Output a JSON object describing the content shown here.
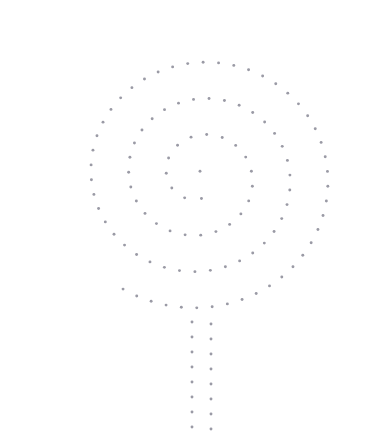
{
  "canvas": {
    "width": 376,
    "height": 437,
    "background_color": "#ffffff"
  },
  "marker": {
    "color": "#9a9aa5",
    "radius": 1.45,
    "shape": "circle",
    "opacity": 1
  },
  "chart_data": {
    "type": "scatter",
    "title": "",
    "subtitle": "",
    "xlabel": "",
    "ylabel": "",
    "xlim": [
      0,
      376
    ],
    "ylim": [
      0,
      437
    ],
    "grid": false,
    "axes_visible": false,
    "tick_labels_x": [],
    "tick_labels_y": [],
    "legend": null,
    "legend_position": "none",
    "annotations": [],
    "series": [
      {
        "name": "spiral-balloon",
        "marker_color": "#9a9aa5",
        "point_count": 148,
        "spiral_params": {
          "center_x": 200,
          "center_y": 176,
          "turns": 3.6,
          "r_start": 5,
          "r_end": 141,
          "arc_step": 15.4,
          "theta_start": -1.5707963,
          "y_squash": 0.96
        },
        "points": []
      },
      {
        "name": "string-tail-left",
        "marker_color": "#9a9aa5",
        "point_count": 8,
        "points": [
          [
            192,
            322
          ],
          [
            192,
            337
          ],
          [
            192,
            352
          ],
          [
            192,
            367
          ],
          [
            192,
            382
          ],
          [
            192,
            397
          ],
          [
            192,
            412
          ],
          [
            192,
            427
          ]
        ]
      },
      {
        "name": "string-tail-right",
        "marker_color": "#9a9aa5",
        "point_count": 8,
        "points": [
          [
            211,
            324
          ],
          [
            211,
            339
          ],
          [
            211,
            354
          ],
          [
            211,
            369
          ],
          [
            211,
            384
          ],
          [
            211,
            399
          ],
          [
            211,
            414
          ],
          [
            211,
            429
          ]
        ]
      }
    ]
  }
}
